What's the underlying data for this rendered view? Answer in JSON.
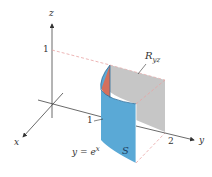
{
  "diagram": {
    "axes": {
      "x_label": "x",
      "y_label": "y",
      "z_label": "z",
      "z_tick": "1",
      "x_tick": "1",
      "y_tick": "2"
    },
    "region_label_main": "R",
    "region_label_sub": "yz",
    "surface_label": "S",
    "curve_label_lhs": "y",
    "curve_label_eq": "=",
    "curve_label_base": "e",
    "curve_label_exp": "x",
    "colors": {
      "surface": "#5aa9d6",
      "surface_edge": "#2f6f9c",
      "region": "#c8c8c8",
      "inner_face": "#d4705c",
      "dashed": "#e8a3a3",
      "axis": "#444444"
    }
  }
}
